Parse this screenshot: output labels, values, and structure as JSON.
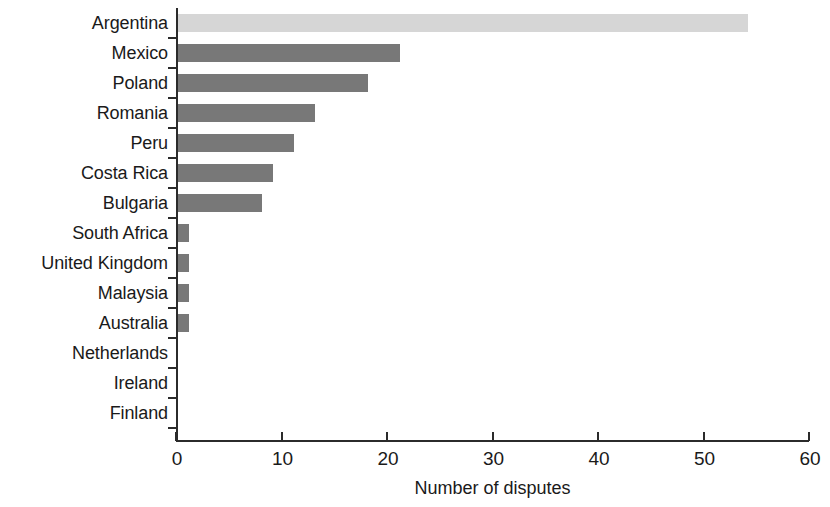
{
  "chart_data": {
    "type": "bar",
    "orientation": "horizontal",
    "title": "",
    "xlabel": "Number of disputes",
    "ylabel": "",
    "xlim": [
      0,
      60
    ],
    "xticks": [
      0,
      10,
      20,
      30,
      40,
      50,
      60
    ],
    "grid": false,
    "legend": "none",
    "categories": [
      "Argentina",
      "Mexico",
      "Poland",
      "Romania",
      "Peru",
      "Costa Rica",
      "Bulgaria",
      "South Africa",
      "United Kingdom",
      "Malaysia",
      "Australia",
      "Netherlands",
      "Ireland",
      "Finland"
    ],
    "values": [
      54,
      21,
      18,
      13,
      11,
      9,
      8,
      1,
      1,
      1,
      1,
      0,
      0,
      0
    ],
    "bar_colors": [
      "#d6d6d6",
      "#787878",
      "#787878",
      "#787878",
      "#787878",
      "#787878",
      "#787878",
      "#787878",
      "#787878",
      "#787878",
      "#787878",
      "#787878",
      "#787878",
      "#787878"
    ],
    "colors": {
      "highlight_bar": "#d6d6d6",
      "default_bar": "#787878",
      "axis": "#2b2b2b",
      "text": "#1a1a1a",
      "background": "#ffffff"
    }
  }
}
